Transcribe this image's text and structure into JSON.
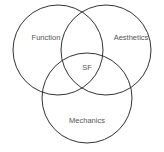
{
  "diagram": {
    "type": "venn",
    "sets": [
      {
        "label": "Function"
      },
      {
        "label": "Aesthetics"
      },
      {
        "label": "Mechanics"
      }
    ],
    "intersection_label": "SF",
    "stroke_color": "#333333"
  }
}
